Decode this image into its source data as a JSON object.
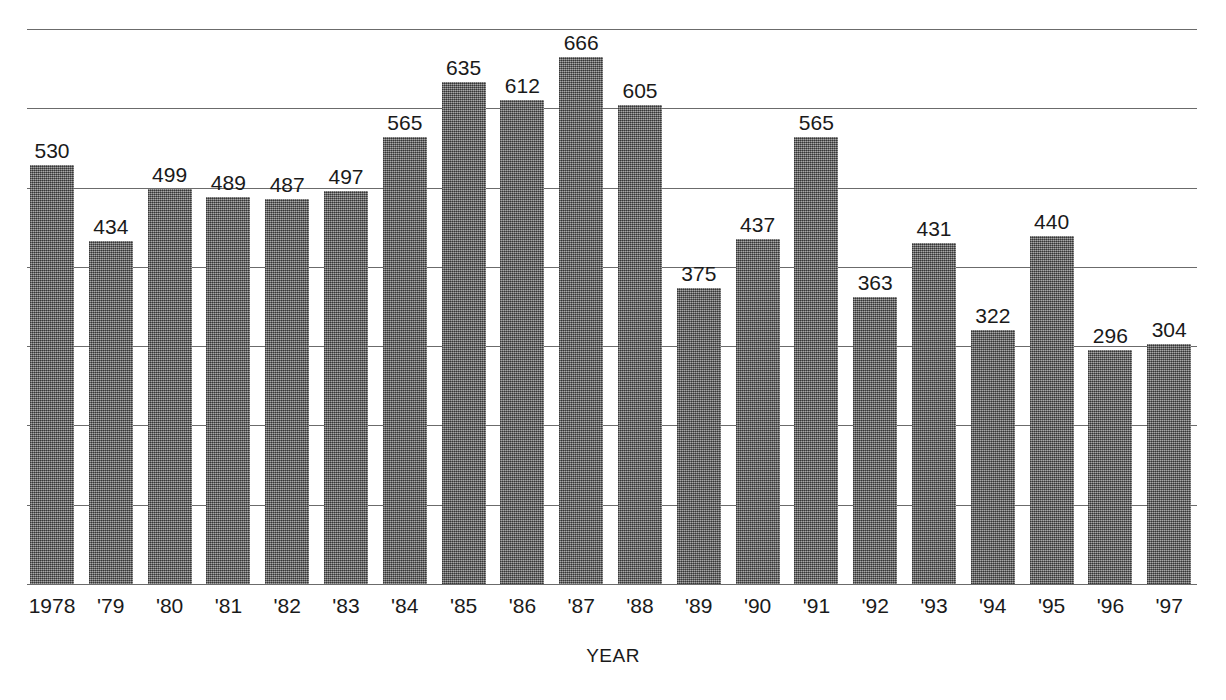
{
  "chart_data": {
    "type": "bar",
    "title": "",
    "xlabel": "YEAR",
    "ylabel": "",
    "ylim": [
      0,
      700
    ],
    "grid": true,
    "gridlines": [
      100,
      200,
      300,
      400,
      500,
      600,
      700
    ],
    "legend": "none",
    "categories": [
      "1978",
      "'79",
      "'80",
      "'81",
      "'82",
      "'83",
      "'84",
      "'85",
      "'86",
      "'87",
      "'88",
      "'89",
      "'90",
      "'91",
      "'92",
      "'93",
      "'94",
      "'95",
      "'96",
      "'97"
    ],
    "values": [
      530,
      434,
      499,
      489,
      487,
      497,
      565,
      635,
      612,
      666,
      605,
      375,
      437,
      565,
      363,
      431,
      322,
      440,
      296,
      304
    ],
    "data_labels": [
      "530",
      "434",
      "499",
      "489",
      "487",
      "497",
      "565",
      "635",
      "612",
      "666",
      "605",
      "375",
      "437",
      "565",
      "363",
      "431",
      "322",
      "440",
      "296",
      "304"
    ],
    "bar_color": "#6e6e6e",
    "grid_color": "#6b6b6b",
    "text_color": "#1a1a1a"
  },
  "axis": {
    "x_title": "YEAR"
  }
}
